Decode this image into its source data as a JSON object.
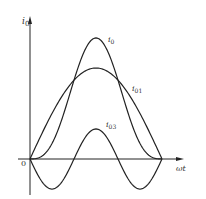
{
  "chart_data": {
    "type": "line",
    "title": "",
    "xlabel": "ωt",
    "ylabel": "i0",
    "origin_label": "0",
    "x_range_rad": [
      0,
      3.14159
    ],
    "grid": false,
    "legend": "inline labels",
    "series": [
      {
        "name": "i0",
        "label_main": "i",
        "label_sub": "0",
        "description": "resultant = i01 + i03 (peaked wave)",
        "amplitude_relative": 1.33
      },
      {
        "name": "i01",
        "label_main": "i",
        "label_sub": "01",
        "description": "fundamental sin(ωt)",
        "amplitude_relative": 1.0
      },
      {
        "name": "i03",
        "label_main": "i",
        "label_sub": "03",
        "description": "third harmonic -0.33·sin(3ωt)",
        "amplitude_relative": 0.33
      }
    ],
    "sample_points": {
      "x_deg": [
        0,
        30,
        60,
        90,
        120,
        150,
        180
      ],
      "i01": [
        0,
        0.5,
        0.866,
        1.0,
        0.866,
        0.5,
        0
      ],
      "i03": [
        0,
        -0.33,
        0,
        0.33,
        0,
        -0.33,
        0
      ],
      "i0": [
        0,
        0.17,
        0.866,
        1.33,
        0.866,
        0.17,
        0
      ]
    }
  },
  "labels": {
    "y_axis_main": "i",
    "y_axis_sub": "0",
    "x_axis": "ωt",
    "origin": "0",
    "i0_main": "i",
    "i0_sub": "0",
    "i01_main": "i",
    "i01_sub": "01",
    "i03_main": "i",
    "i03_sub": "03"
  }
}
